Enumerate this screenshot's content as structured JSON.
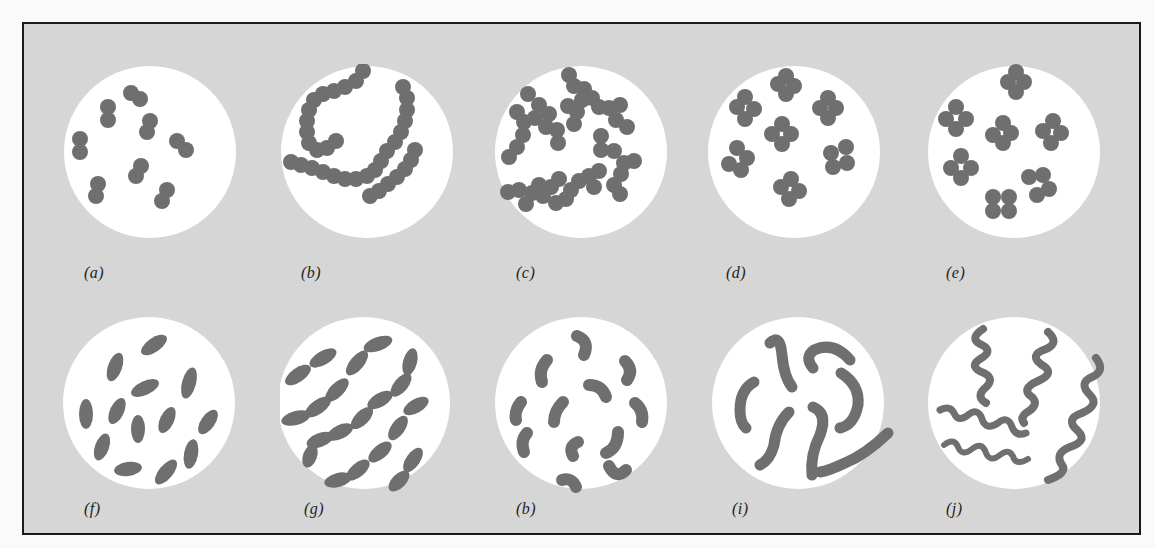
{
  "figure": {
    "frame_color": "#d6d6d6",
    "circle_color": "#ffffff",
    "cell_color": "#6f6f6f",
    "border_color": "#1a1a1a",
    "rows": [
      {
        "row": "top",
        "panels": [
          {
            "id": "a",
            "label": "(a)",
            "icon": "diplococci-icon",
            "description": "pairs of cocci"
          },
          {
            "id": "b",
            "label": "(b)",
            "icon": "streptococci-icon",
            "description": "chains of cocci"
          },
          {
            "id": "c",
            "label": "(c)",
            "icon": "staphylococci-icon",
            "description": "grape-like clusters of cocci"
          },
          {
            "id": "d",
            "label": "(d)",
            "icon": "tetrad-icon",
            "description": "groups of four cocci"
          },
          {
            "id": "e",
            "label": "(e)",
            "icon": "sarcinae-icon",
            "description": "cubical packets of cocci"
          }
        ]
      },
      {
        "row": "bottom",
        "panels": [
          {
            "id": "f",
            "label": "(f)",
            "icon": "bacilli-icon",
            "description": "single rods"
          },
          {
            "id": "g",
            "label": "(g)",
            "icon": "streptobacilli-icon",
            "description": "chains of rods"
          },
          {
            "id": "h",
            "label": "(b)",
            "icon": "vibrio-icon",
            "description": "comma-shaped curved rods"
          },
          {
            "id": "i",
            "label": "(i)",
            "icon": "spirilla-icon",
            "description": "curved rigid spirals"
          },
          {
            "id": "j",
            "label": "(j)",
            "icon": "spirochete-icon",
            "description": "flexible wavy spirals"
          }
        ]
      }
    ]
  }
}
